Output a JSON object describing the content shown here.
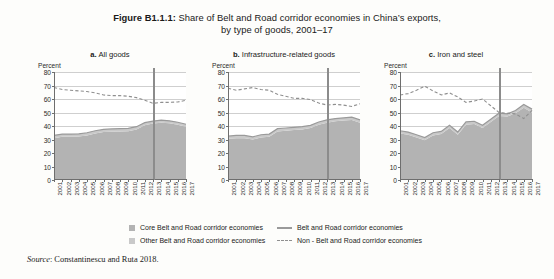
{
  "figure": {
    "label": "Figure B1.1.1:",
    "title_line1": "Share of Belt and Road corridor economies in China’s exports,",
    "title_line2": "by type of goods, 2001–17",
    "source_prefix": "Source",
    "source_text": ": Constantinescu and Ruta 2018."
  },
  "legend": {
    "items": [
      {
        "key": "core",
        "label": "Core Belt and Road corridor economies",
        "style": "area",
        "color": "#b3b3b3"
      },
      {
        "key": "other",
        "label": "Other Belt and Road corridor economies",
        "style": "area",
        "color": "#c9c9c9"
      },
      {
        "key": "bri",
        "label": "Belt and Road corridor economies",
        "style": "solid",
        "color": "#9a9a9a"
      },
      {
        "key": "nonbri",
        "label": "Non - Belt and Road corridor economies",
        "style": "dashed",
        "color": "#8f8f8f"
      }
    ]
  },
  "axis": {
    "unit_label": "Percent",
    "y_ticks": [
      0,
      10,
      20,
      30,
      40,
      50,
      60,
      70,
      80
    ],
    "ylim": [
      0,
      80
    ],
    "x_ticks": [
      "2001",
      "2002",
      "2003",
      "2004",
      "2005",
      "2006",
      "2007",
      "2008",
      "2009",
      "2010",
      "2011",
      "2012",
      "2013",
      "2014",
      "2015",
      "2016",
      "2017"
    ],
    "reference_year": "2013"
  },
  "chart_data": [
    {
      "id": "a",
      "type": "area",
      "panel_letter": "a.",
      "panel_name": "All goods",
      "title": "a. All goods",
      "xlabel": "",
      "ylabel": "Percent",
      "ylim": [
        0,
        80
      ],
      "grid": true,
      "legend_position": "bottom",
      "x": [
        2001,
        2002,
        2003,
        2004,
        2005,
        2006,
        2007,
        2008,
        2009,
        2010,
        2011,
        2012,
        2013,
        2014,
        2015,
        2016,
        2017
      ],
      "reference_line_x": 2013,
      "series": [
        {
          "name": "Core Belt and Road corridor economies",
          "style": "area",
          "color": "#b3b3b3",
          "values": [
            31.0,
            32.0,
            32.0,
            32.2,
            33.0,
            34.5,
            35.5,
            35.8,
            36.0,
            36.2,
            37.5,
            40.5,
            41.8,
            42.5,
            42.0,
            41.0,
            39.5
          ]
        },
        {
          "name": "Other Belt and Road corridor economies",
          "style": "area",
          "color": "#c9c9c9",
          "values": [
            2.0,
            2.0,
            2.0,
            2.0,
            2.0,
            2.0,
            2.0,
            2.0,
            2.0,
            2.0,
            2.0,
            2.0,
            1.8,
            1.8,
            1.8,
            1.8,
            1.8
          ]
        },
        {
          "name": "Belt and Road corridor economies",
          "style": "total-line",
          "color": "#9a9a9a",
          "values": [
            33.0,
            34.0,
            34.0,
            34.2,
            35.0,
            36.5,
            37.5,
            37.8,
            38.0,
            38.2,
            39.5,
            42.5,
            43.6,
            44.3,
            43.8,
            42.8,
            41.3
          ]
        },
        {
          "name": "Non - Belt and Road corridor economies",
          "style": "dashed",
          "color": "#8f8f8f",
          "values": [
            68.5,
            67.0,
            66.5,
            66.0,
            65.5,
            64.5,
            63.0,
            62.5,
            62.5,
            62.0,
            61.0,
            59.0,
            56.8,
            57.5,
            57.5,
            57.8,
            59.0
          ]
        }
      ]
    },
    {
      "id": "b",
      "type": "area",
      "panel_letter": "b.",
      "panel_name": "Infrastructure-related goods",
      "title": "b. Infrastructure-related goods",
      "xlabel": "",
      "ylabel": "Percent",
      "ylim": [
        0,
        80
      ],
      "grid": true,
      "legend_position": "bottom",
      "x": [
        2001,
        2002,
        2003,
        2004,
        2005,
        2006,
        2007,
        2008,
        2009,
        2010,
        2011,
        2012,
        2013,
        2014,
        2015,
        2016,
        2017
      ],
      "reference_line_x": 2013,
      "series": [
        {
          "name": "Core Belt and Road corridor economies",
          "style": "area",
          "color": "#b3b3b3",
          "values": [
            30.5,
            31.0,
            31.0,
            30.0,
            31.5,
            32.0,
            36.0,
            36.5,
            37.0,
            37.5,
            38.5,
            41.0,
            42.5,
            43.5,
            44.0,
            44.5,
            42.5
          ]
        },
        {
          "name": "Other Belt and Road corridor economies",
          "style": "area",
          "color": "#c9c9c9",
          "values": [
            2.0,
            2.0,
            2.0,
            2.0,
            2.0,
            2.0,
            2.0,
            2.0,
            2.0,
            2.0,
            2.0,
            2.0,
            2.0,
            2.0,
            2.0,
            2.0,
            2.0
          ]
        },
        {
          "name": "Belt and Road corridor economies",
          "style": "total-line",
          "color": "#9a9a9a",
          "values": [
            32.5,
            33.0,
            33.0,
            32.0,
            33.5,
            34.0,
            38.0,
            38.5,
            39.0,
            39.5,
            40.5,
            43.0,
            44.5,
            45.5,
            46.0,
            46.5,
            44.5
          ]
        },
        {
          "name": "Non - Belt and Road corridor economies",
          "style": "dashed",
          "color": "#8f8f8f",
          "values": [
            68.0,
            66.5,
            67.5,
            68.5,
            67.0,
            66.5,
            63.5,
            62.0,
            60.5,
            60.5,
            59.5,
            57.0,
            55.5,
            56.0,
            55.5,
            54.5,
            56.5
          ]
        }
      ]
    },
    {
      "id": "c",
      "type": "area",
      "panel_letter": "c.",
      "panel_name": "Iron and steel",
      "title": "c. Iron and steel",
      "xlabel": "",
      "ylabel": "Percent",
      "ylim": [
        0,
        80
      ],
      "grid": true,
      "legend_position": "bottom",
      "x": [
        2001,
        2002,
        2003,
        2004,
        2005,
        2006,
        2007,
        2008,
        2009,
        2010,
        2011,
        2012,
        2013,
        2014,
        2015,
        2016,
        2017
      ],
      "reference_line_x": 2013,
      "series": [
        {
          "name": "Core Belt and Road corridor economies",
          "style": "area",
          "color": "#b3b3b3",
          "values": [
            34.5,
            33.5,
            31.5,
            29.5,
            33.0,
            34.0,
            38.5,
            33.5,
            41.0,
            41.5,
            38.5,
            43.0,
            47.5,
            47.0,
            49.5,
            53.5,
            50.0
          ]
        },
        {
          "name": "Other Belt and Road corridor economies",
          "style": "area",
          "color": "#c9c9c9",
          "values": [
            2.0,
            2.0,
            2.0,
            2.0,
            2.0,
            2.0,
            2.0,
            2.0,
            2.0,
            2.0,
            2.0,
            2.0,
            2.0,
            2.0,
            2.0,
            2.5,
            2.5
          ]
        },
        {
          "name": "Belt and Road corridor economies",
          "style": "total-line",
          "color": "#9a9a9a",
          "values": [
            36.5,
            35.5,
            33.5,
            31.5,
            35.0,
            36.0,
            40.5,
            35.5,
            43.0,
            43.5,
            40.5,
            45.0,
            49.5,
            49.0,
            51.5,
            56.0,
            52.5
          ]
        },
        {
          "name": "Non - Belt and Road corridor economies",
          "style": "dashed",
          "color": "#8f8f8f",
          "values": [
            63.0,
            64.0,
            66.5,
            69.5,
            66.0,
            63.0,
            64.5,
            61.5,
            57.5,
            58.5,
            60.0,
            55.0,
            50.0,
            49.5,
            49.0,
            45.5,
            51.5
          ]
        }
      ]
    }
  ]
}
